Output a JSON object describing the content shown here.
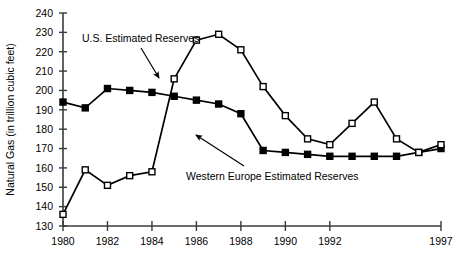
{
  "chart_data": {
    "type": "line",
    "title": "",
    "xlabel": "",
    "ylabel": "Natural Gas (in trillion cubic feet)",
    "ylim": [
      130,
      240
    ],
    "ytick_step": 10,
    "yticks": [
      130,
      140,
      150,
      160,
      170,
      180,
      190,
      200,
      210,
      220,
      230,
      240
    ],
    "xticks": [
      1980,
      1982,
      1984,
      1986,
      1988,
      1990,
      1992,
      1997
    ],
    "x": [
      1980,
      1981,
      1982,
      1983,
      1984,
      1985,
      1986,
      1987,
      1988,
      1989,
      1990,
      1991,
      1992,
      1993,
      1994,
      1995,
      1996,
      1997
    ],
    "grid": false,
    "legend_position": "none",
    "series": [
      {
        "name": "U.S. Estimated Reserves",
        "marker": "filled-square",
        "color": "#000000",
        "values": [
          194,
          191,
          201,
          200,
          199,
          197,
          195,
          193,
          188,
          169,
          168,
          167,
          166,
          166,
          166,
          166,
          168,
          170
        ]
      },
      {
        "name": "Western Europe Estimated Reserves",
        "marker": "open-square",
        "color": "#000000",
        "values": [
          136,
          159,
          151,
          156,
          158,
          206,
          226,
          229,
          221,
          202,
          187,
          175,
          172,
          183,
          194,
          175,
          168,
          172
        ]
      }
    ],
    "annotations": [
      {
        "name": "us-estimated-reserves-annotation",
        "text": "U.S. Estimated Reserves",
        "text_x": 82,
        "text_y": 42,
        "arrow_x1": 141,
        "arrow_y1": 48,
        "arrow_x2": 159,
        "arrow_y2": 78
      },
      {
        "name": "western-europe-estimated-reserves-annotation",
        "text": "Western Europe Estimated Reserves",
        "text_x": 186,
        "text_y": 180,
        "arrow_x1": 244,
        "arrow_y1": 166,
        "arrow_x2": 196,
        "arrow_y2": 135
      }
    ]
  }
}
